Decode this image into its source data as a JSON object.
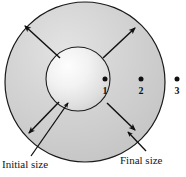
{
  "figure": {
    "background_color": "#ffffff",
    "outline_color": "#1a1a1a",
    "annulus_fill": "#d2d2d2",
    "inner_highlight": "#fbfbfb",
    "inner_edge": "#bdbdbd",
    "arrow_color": "#101010"
  },
  "shapes": {
    "outer_circle": {
      "cx": 85,
      "cy": 82,
      "r": 80,
      "label": "final size sphere"
    },
    "inner_circle": {
      "cx": 78,
      "cy": 79,
      "r": 32,
      "label": "initial size sphere"
    }
  },
  "points": [
    {
      "id": "point-1",
      "label": "1",
      "x": 105,
      "y": 79,
      "label_x": 99,
      "label_y": 85
    },
    {
      "id": "point-2",
      "label": "2",
      "x": 141,
      "y": 79,
      "label_x": 135,
      "label_y": 85
    },
    {
      "id": "point-3",
      "label": "3",
      "x": 177,
      "y": 79,
      "label_x": 171,
      "label_y": 85
    }
  ],
  "captions": {
    "initial": "Initial size",
    "final": "Final size"
  },
  "radial_arrows": [
    {
      "id": "arrow-upper-left",
      "x1": 60,
      "y1": 58,
      "x2": 25,
      "y2": 26
    },
    {
      "id": "arrow-upper-right",
      "x1": 103,
      "y1": 58,
      "x2": 135,
      "y2": 28
    },
    {
      "id": "arrow-lower-left",
      "x1": 59,
      "y1": 102,
      "x2": 29,
      "y2": 133
    },
    {
      "id": "arrow-lower-right",
      "x1": 107,
      "y1": 103,
      "x2": 135,
      "y2": 130
    }
  ],
  "pointer_arrows": [
    {
      "id": "pointer-initial-size",
      "x1": 32,
      "y1": 155,
      "x2": 68,
      "y2": 104,
      "target": "inner_circle"
    },
    {
      "id": "pointer-final-size",
      "x1": 144,
      "y1": 150,
      "x2": 128,
      "y2": 133,
      "target": "outer_circle"
    }
  ]
}
